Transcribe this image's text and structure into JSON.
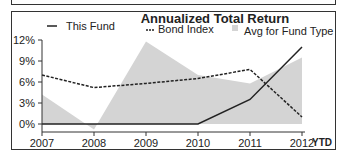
{
  "chart_data": {
    "type": "line",
    "title": "Annualized Total Return",
    "xlabel": "",
    "ylabel": "",
    "categories": [
      "2007",
      "2008",
      "2009",
      "2010",
      "2011",
      "2012"
    ],
    "x_suffix_label": "YTD",
    "ylim": [
      0,
      12
    ],
    "y_ticks": [
      "0%",
      "3%",
      "6%",
      "9%",
      "12%"
    ],
    "series": [
      {
        "name": "This Fund",
        "type": "line",
        "style": "solid",
        "color": "#222222",
        "values": [
          0.0,
          0.0,
          0.0,
          0.0,
          3.5,
          11.0
        ]
      },
      {
        "name": "Bond Index",
        "type": "line",
        "style": "dashed",
        "color": "#222222",
        "values": [
          7.0,
          5.2,
          5.8,
          6.5,
          7.8,
          1.0
        ]
      },
      {
        "name": "Avg for Fund Type",
        "type": "area",
        "color": "#d4d4d4",
        "values": [
          4.2,
          -0.8,
          11.8,
          7.0,
          5.8,
          9.5
        ]
      }
    ],
    "legend_position": "top",
    "grid": false
  },
  "legend": {
    "this_fund": "This Fund",
    "bond_index": "Bond Index",
    "avg_fund_type": "Avg for Fund Type"
  }
}
